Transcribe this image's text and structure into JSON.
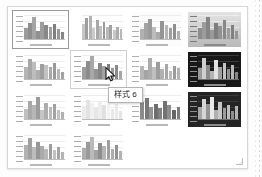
{
  "panel": {
    "name": "chart-style-gallery",
    "columns": 4,
    "total_styles": 14
  },
  "tooltip": {
    "visible": true,
    "text": "样式 6"
  },
  "cursor": {
    "icon": "arrow-pointer-icon",
    "x": 104,
    "y": 66
  },
  "resize_grip": {
    "icon": "resize-grip-icon"
  },
  "colors": {
    "panel_bg": "#ffffff",
    "panel_border": "#d6d6d6",
    "selected_border": "#9a9a9a",
    "selected_fill": "#ececec",
    "hover_border": "#cfcfcf",
    "hover_fill": "#f8f8f8",
    "tooltip_bg": "#ffffff",
    "tooltip_border": "#b4b4b4",
    "dark_thumb_bg": "#181818"
  },
  "styles": [
    {
      "label": "样式 1",
      "name": "chart-style-1",
      "state": "selected",
      "background": "bg-white",
      "axis": true,
      "bars": [
        {
          "h": 46,
          "c": "#9b9b9b"
        },
        {
          "h": 68,
          "c": "#8e8e8e"
        },
        {
          "h": 90,
          "c": "#a5a5a5"
        },
        {
          "h": 34,
          "c": "#909090"
        },
        {
          "h": 72,
          "c": "#9d9d9d"
        },
        {
          "h": 58,
          "c": "#888888"
        },
        {
          "h": 50,
          "c": "#a0a0a0"
        },
        {
          "h": 63,
          "c": "#7f7f7f"
        },
        {
          "h": 40,
          "c": "#999999"
        },
        {
          "h": 30,
          "c": "#868686"
        }
      ]
    },
    {
      "label": "样式 2",
      "name": "chart-style-2",
      "state": "normal",
      "background": "bg-white",
      "axis": false,
      "bars": [
        {
          "h": 62,
          "c": "#c6c6c6"
        },
        {
          "h": 88,
          "c": "#9e9e9e"
        },
        {
          "h": 96,
          "c": "#b4b4b4"
        },
        {
          "h": 44,
          "c": "#cccccc"
        },
        {
          "h": 78,
          "c": "#a8a8a8"
        },
        {
          "h": 56,
          "c": "#c0c0c0"
        },
        {
          "h": 70,
          "c": "#9a9a9a"
        },
        {
          "h": 48,
          "c": "#bbbbbb"
        },
        {
          "h": 60,
          "c": "#a2a2a2"
        },
        {
          "h": 36,
          "c": "#c8c8c8"
        },
        {
          "h": 52,
          "c": "#adadad"
        },
        {
          "h": 42,
          "c": "#b8b8b8"
        }
      ]
    },
    {
      "label": "样式 3",
      "name": "chart-style-3",
      "state": "normal",
      "background": "bg-offwhite",
      "axis": true,
      "bars": [
        {
          "h": 40,
          "c": "#b0b0b0"
        },
        {
          "h": 66,
          "c": "#a4a4a4"
        },
        {
          "h": 82,
          "c": "#9a9a9a"
        },
        {
          "h": 52,
          "c": "#bcbcbc"
        },
        {
          "h": 30,
          "c": "#aaaaaa"
        },
        {
          "h": 74,
          "c": "#959595"
        },
        {
          "h": 58,
          "c": "#b6b6b6"
        },
        {
          "h": 44,
          "c": "#a0a0a0"
        },
        {
          "h": 64,
          "c": "#8f8f8f"
        },
        {
          "h": 34,
          "c": "#b2b2b2"
        }
      ]
    },
    {
      "label": "样式 4",
      "name": "chart-style-4",
      "state": "normal",
      "background": "bg-grad",
      "axis": true,
      "bars": [
        {
          "h": 44,
          "c": "#8c8c8c"
        },
        {
          "h": 70,
          "c": "#9c9c9c"
        },
        {
          "h": 92,
          "c": "#858585"
        },
        {
          "h": 38,
          "c": "#9a9a9a"
        },
        {
          "h": 66,
          "c": "#7e7e7e"
        },
        {
          "h": 54,
          "c": "#929292"
        },
        {
          "h": 78,
          "c": "#888888"
        },
        {
          "h": 46,
          "c": "#9e9e9e"
        },
        {
          "h": 60,
          "c": "#808080"
        },
        {
          "h": 32,
          "c": "#969696"
        }
      ]
    },
    {
      "label": "样式 5",
      "name": "chart-style-5",
      "state": "normal",
      "background": "bg-white",
      "axis": true,
      "bars": [
        {
          "h": 52,
          "c": "#b4b4b4"
        },
        {
          "h": 84,
          "c": "#a6a6a6"
        },
        {
          "h": 72,
          "c": "#bdbdbd"
        },
        {
          "h": 36,
          "c": "#aeaeae"
        },
        {
          "h": 64,
          "c": "#9f9f9f"
        },
        {
          "h": 58,
          "c": "#c2c2c2"
        },
        {
          "h": 48,
          "c": "#a9a9a9"
        },
        {
          "h": 66,
          "c": "#999999"
        },
        {
          "h": 40,
          "c": "#b8b8b8"
        },
        {
          "h": 30,
          "c": "#a3a3a3"
        }
      ]
    },
    {
      "label": "样式 6",
      "name": "chart-style-6",
      "state": "hovered",
      "background": "bg-white",
      "axis": true,
      "bars": [
        {
          "h": 48,
          "c": "#9e9e9e"
        },
        {
          "h": 76,
          "c": "#8c8c8c"
        },
        {
          "h": 94,
          "c": "#a8a8a8"
        },
        {
          "h": 40,
          "c": "#949494"
        },
        {
          "h": 68,
          "c": "#868686"
        },
        {
          "h": 56,
          "c": "#a2a2a2"
        },
        {
          "h": 62,
          "c": "#7d7d7d"
        },
        {
          "h": 44,
          "c": "#9a9a9a"
        },
        {
          "h": 58,
          "c": "#8a8a8a"
        },
        {
          "h": 34,
          "c": "#a6a6a6"
        }
      ]
    },
    {
      "label": "样式 7",
      "name": "chart-style-7",
      "state": "normal",
      "background": "bg-white",
      "axis": true,
      "bars": [
        {
          "h": 56,
          "c": "#b6b6b6"
        },
        {
          "h": 38,
          "c": "#a4a4a4"
        },
        {
          "h": 88,
          "c": "#acacac"
        },
        {
          "h": 50,
          "c": "#bfbfbf"
        },
        {
          "h": 70,
          "c": "#9d9d9d"
        },
        {
          "h": 42,
          "c": "#b1b1b1"
        },
        {
          "h": 64,
          "c": "#a7a7a7"
        },
        {
          "h": 32,
          "c": "#bababa"
        },
        {
          "h": 54,
          "c": "#9b9b9b"
        },
        {
          "h": 46,
          "c": "#b4b4b4"
        }
      ]
    },
    {
      "label": "样式 8",
      "name": "chart-style-8",
      "state": "normal",
      "background": "bg-dark",
      "axis": true,
      "bars": [
        {
          "h": 44,
          "c": "#9a9a9a"
        },
        {
          "h": 86,
          "c": "#cfcfcf"
        },
        {
          "h": 60,
          "c": "#8a8a8a"
        },
        {
          "h": 34,
          "c": "#b4b4b4"
        },
        {
          "h": 78,
          "c": "#e2e2e2"
        },
        {
          "h": 52,
          "c": "#a0a0a0"
        },
        {
          "h": 66,
          "c": "#c4c4c4"
        },
        {
          "h": 40,
          "c": "#909090"
        },
        {
          "h": 58,
          "c": "#b8b8b8"
        },
        {
          "h": 28,
          "c": "#868686"
        }
      ]
    },
    {
      "label": "样式 9",
      "name": "chart-style-9",
      "state": "normal",
      "background": "bg-white",
      "axis": true,
      "bars": [
        {
          "h": 42,
          "c": "#c0c0c0"
        },
        {
          "h": 74,
          "c": "#a8a8a8"
        },
        {
          "h": 58,
          "c": "#b6b6b6"
        },
        {
          "h": 90,
          "c": "#9c9c9c"
        },
        {
          "h": 36,
          "c": "#c6c6c6"
        },
        {
          "h": 66,
          "c": "#aeaeae"
        },
        {
          "h": 48,
          "c": "#bbbbbb"
        },
        {
          "h": 62,
          "c": "#a2a2a2"
        },
        {
          "h": 38,
          "c": "#c3c3c3"
        },
        {
          "h": 30,
          "c": "#b0b0b0"
        }
      ]
    },
    {
      "label": "样式 10",
      "name": "chart-style-10",
      "state": "normal",
      "background": "bg-white",
      "axis": true,
      "bars": [
        {
          "h": 54,
          "c": "#ececec"
        },
        {
          "h": 80,
          "c": "#e2e2e2"
        },
        {
          "h": 66,
          "c": "#f0f0f0"
        },
        {
          "h": 44,
          "c": "#e6e6e6"
        },
        {
          "h": 72,
          "c": "#ededed"
        },
        {
          "h": 58,
          "c": "#e0e0e0"
        },
        {
          "h": 86,
          "c": "#f2f2f2"
        },
        {
          "h": 40,
          "c": "#e8e8e8"
        },
        {
          "h": 62,
          "c": "#eaeaea"
        },
        {
          "h": 32,
          "c": "#e4e4e4"
        }
      ]
    },
    {
      "label": "样式 11",
      "name": "chart-style-11",
      "state": "normal",
      "background": "bg-white",
      "axis": true,
      "bars": [
        {
          "h": 70,
          "c": "#8a8a8a"
        },
        {
          "h": 88,
          "c": "#787878"
        },
        {
          "h": 52,
          "c": "#949494"
        },
        {
          "h": 64,
          "c": "#6e6e6e"
        },
        {
          "h": 46,
          "c": "#828282"
        },
        {
          "h": 76,
          "c": "#737373"
        },
        {
          "h": 58,
          "c": "#8e8e8e"
        },
        {
          "h": 38,
          "c": "#666666"
        },
        {
          "h": 50,
          "c": "#7e7e7e"
        }
      ]
    },
    {
      "label": "样式 12",
      "name": "chart-style-12",
      "state": "normal",
      "background": "bg-dark2",
      "axis": true,
      "bars": [
        {
          "h": 50,
          "c": "#a6a6a6"
        },
        {
          "h": 82,
          "c": "#d6d6d6"
        },
        {
          "h": 62,
          "c": "#949494"
        },
        {
          "h": 92,
          "c": "#e8e8e8"
        },
        {
          "h": 38,
          "c": "#b0b0b0"
        },
        {
          "h": 70,
          "c": "#c8c8c8"
        },
        {
          "h": 46,
          "c": "#9c9c9c"
        },
        {
          "h": 60,
          "c": "#bebebe"
        },
        {
          "h": 34,
          "c": "#8e8e8e"
        },
        {
          "h": 54,
          "c": "#b4b4b4"
        }
      ]
    },
    {
      "label": "样式 13",
      "name": "chart-style-13",
      "state": "normal",
      "background": "bg-white",
      "axis": true,
      "bars": [
        {
          "h": 60,
          "c": "#b2b2b2"
        },
        {
          "h": 86,
          "c": "#a0a0a0"
        },
        {
          "h": 48,
          "c": "#bcbcbc"
        },
        {
          "h": 70,
          "c": "#969696"
        },
        {
          "h": 56,
          "c": "#aaaaaa"
        },
        {
          "h": 42,
          "c": "#b8b8b8"
        },
        {
          "h": 64,
          "c": "#9e9e9e"
        },
        {
          "h": 36,
          "c": "#c0c0c0"
        },
        {
          "h": 52,
          "c": "#a6a6a6"
        },
        {
          "h": 30,
          "c": "#b4b4b4"
        }
      ]
    },
    {
      "label": "样式 14",
      "name": "chart-style-14",
      "state": "normal",
      "background": "bg-white",
      "axis": true,
      "bars": [
        {
          "h": 44,
          "c": "#aeaeae"
        },
        {
          "h": 72,
          "c": "#9a9a9a"
        },
        {
          "h": 90,
          "c": "#bababa"
        },
        {
          "h": 38,
          "c": "#a4a4a4"
        },
        {
          "h": 66,
          "c": "#8e8e8e"
        },
        {
          "h": 54,
          "c": "#b6b6b6"
        },
        {
          "h": 78,
          "c": "#a0a0a0"
        },
        {
          "h": 40,
          "c": "#acacac"
        },
        {
          "h": 58,
          "c": "#929292"
        },
        {
          "h": 32,
          "c": "#b2b2b2"
        }
      ]
    }
  ]
}
